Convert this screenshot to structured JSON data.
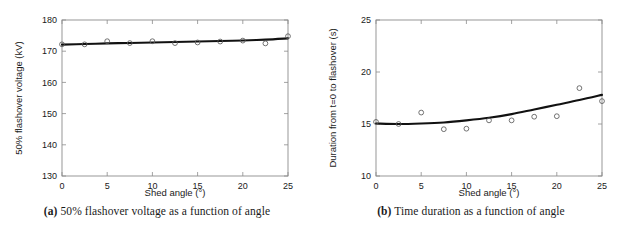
{
  "figure": {
    "panels": [
      {
        "id": "a",
        "caption_label": "(a)",
        "caption_text": "50% flashover voltage as a function of angle",
        "chart": {
          "type": "scatter",
          "title": "",
          "xlabel": "Shed angle (°)",
          "ylabel": "50% flashover voltage (kV)",
          "xlim": [
            0,
            25
          ],
          "ylim": [
            130,
            180
          ],
          "xticks": [
            0,
            5,
            10,
            15,
            20,
            25
          ],
          "yticks": [
            130,
            140,
            150,
            160,
            170,
            180
          ],
          "xticklabels": [
            "0",
            "5",
            "10",
            "15",
            "20",
            "25"
          ],
          "yticklabels": [
            "130",
            "140",
            "150",
            "160",
            "170",
            "180"
          ],
          "grid": false,
          "legend": "none",
          "series": [
            {
              "name": "measured",
              "style": "open-circle-markers",
              "x": [
                0,
                2.5,
                5,
                7.5,
                10,
                12.5,
                15,
                17.5,
                20,
                22.5,
                25
              ],
              "y": [
                172.2,
                172.2,
                173.2,
                172.6,
                173.2,
                172.6,
                172.8,
                173.1,
                173.4,
                172.5,
                174.8
              ]
            },
            {
              "name": "fitted curve",
              "style": "solid-line",
              "x": [
                0,
                2.5,
                5,
                7.5,
                10,
                12.5,
                15,
                17.5,
                20,
                22.5,
                25
              ],
              "y": [
                172.1,
                172.3,
                172.5,
                172.65,
                172.8,
                172.95,
                173.1,
                173.25,
                173.45,
                173.7,
                174.1
              ]
            }
          ]
        }
      },
      {
        "id": "b",
        "caption_label": "(b)",
        "caption_text": "Time duration as a function of angle",
        "chart": {
          "type": "scatter",
          "title": "",
          "xlabel": "Shed angle (°)",
          "ylabel": "Duration from t=0 to flashover (s)",
          "xlim": [
            0,
            25
          ],
          "ylim": [
            10,
            25
          ],
          "xticks": [
            0,
            5,
            10,
            15,
            20,
            25
          ],
          "yticks": [
            10,
            15,
            20,
            25
          ],
          "xticklabels": [
            "0",
            "5",
            "10",
            "15",
            "20",
            "25"
          ],
          "yticklabels": [
            "10",
            "15",
            "20",
            "25"
          ],
          "grid": false,
          "legend": "none",
          "series": [
            {
              "name": "measured",
              "style": "open-circle-markers",
              "x": [
                0,
                2.5,
                5,
                7.5,
                10,
                12.5,
                15,
                17.5,
                20,
                22.5,
                25
              ],
              "y": [
                15.2,
                15.0,
                16.1,
                14.5,
                14.55,
                15.35,
                15.35,
                15.7,
                15.75,
                18.45,
                17.2
              ]
            },
            {
              "name": "fitted curve",
              "style": "solid-line",
              "x": [
                0,
                2.5,
                5,
                7.5,
                10,
                12.5,
                15,
                17.5,
                20,
                22.5,
                25
              ],
              "y": [
                15.05,
                15.0,
                15.05,
                15.15,
                15.35,
                15.6,
                15.95,
                16.4,
                16.85,
                17.3,
                17.8
              ]
            }
          ]
        }
      }
    ]
  }
}
